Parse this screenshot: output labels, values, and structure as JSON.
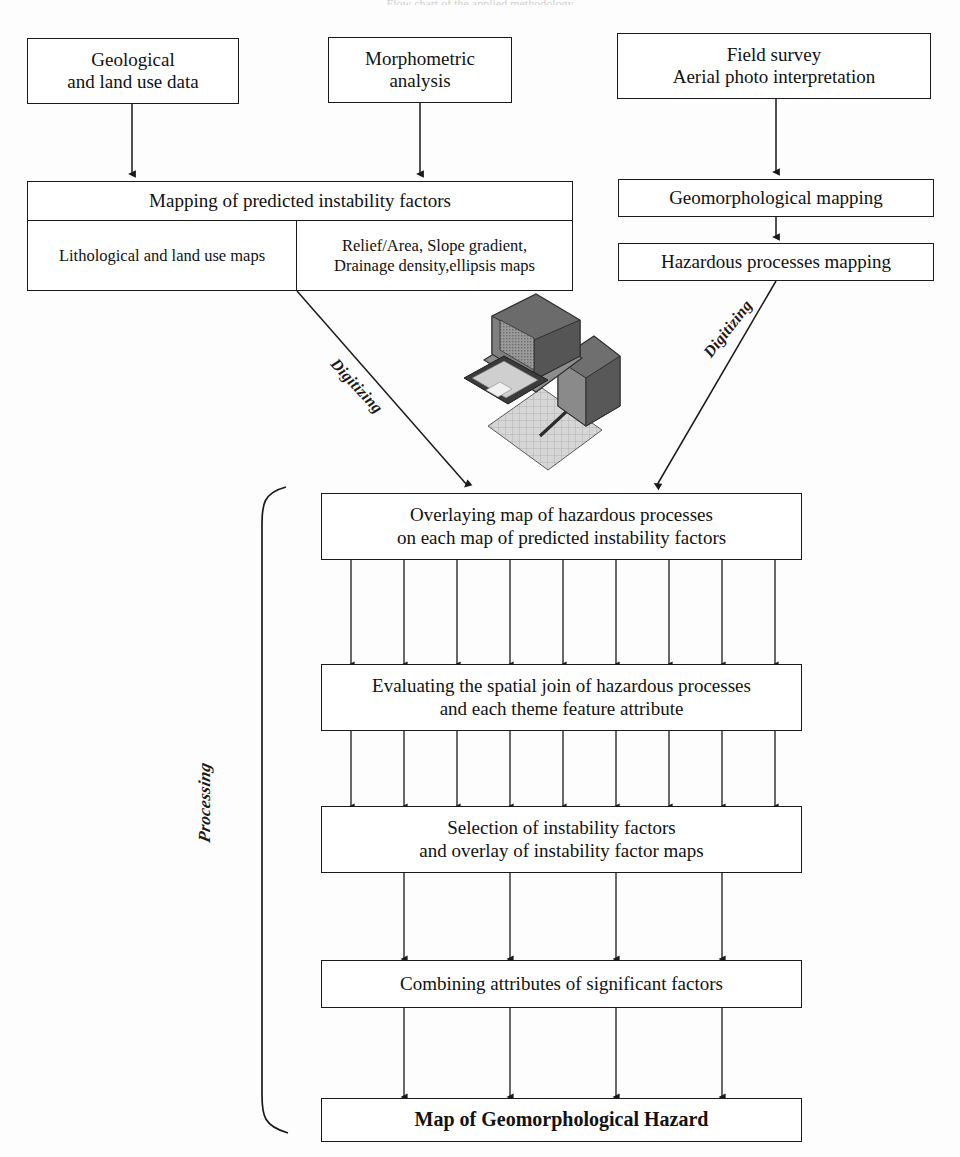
{
  "diagram": {
    "title_cut_off": "Flow chart of the applied methodology",
    "type": "flowchart",
    "orientation": "top-to-bottom"
  },
  "inputs": [
    {
      "id": "geological",
      "lines": [
        "Geological",
        "and land use data"
      ]
    },
    {
      "id": "morphometric",
      "lines": [
        "Morphometric",
        "analysis"
      ]
    },
    {
      "id": "field-survey",
      "lines": [
        "Field survey",
        "Aerial photo interpretation"
      ]
    }
  ],
  "mapping_block": {
    "header": "Mapping of predicted instability factors",
    "cells": [
      {
        "id": "lithological",
        "lines": [
          "Lithological and land use maps"
        ]
      },
      {
        "id": "morphometric-maps",
        "lines": [
          "Relief/Area,  Slope gradient,",
          "Drainage density,ellipsis maps"
        ]
      }
    ]
  },
  "right_chain": [
    {
      "id": "geomorph-mapping",
      "lines": [
        "Geomorphological mapping"
      ]
    },
    {
      "id": "hazardous-mapping",
      "lines": [
        "Hazardous processes mapping"
      ]
    }
  ],
  "edge_labels": {
    "digitizing_left": "Digitizing",
    "digitizing_right": "Digitizing",
    "processing": "Processing"
  },
  "icons": {
    "computer": "computer-workstation-digitizer-icon"
  },
  "processing_steps": [
    {
      "id": "overlaying",
      "lines": [
        "Overlaying map of hazardous processes",
        "on each map of predicted instability factors"
      ],
      "bold": false
    },
    {
      "id": "evaluating",
      "lines": [
        "Evaluating the spatial join of hazardous processes",
        "and each theme feature attribute"
      ],
      "bold": false
    },
    {
      "id": "selection",
      "lines": [
        "Selection of instability factors",
        "and overlay of instability factor maps"
      ],
      "bold": false
    },
    {
      "id": "combining",
      "lines": [
        "Combining attributes of significant factors"
      ],
      "bold": false
    },
    {
      "id": "result",
      "lines": [
        "Map of Geomorphological Hazard"
      ],
      "bold": true
    }
  ],
  "arrow_counts": {
    "overlaying_to_evaluating": 9,
    "evaluating_to_selection": 9,
    "selection_to_combining": 4,
    "combining_to_result": 4
  },
  "colors": {
    "stroke": "#1a1a1a",
    "background": "#fdfdfd",
    "text": "#121212"
  }
}
